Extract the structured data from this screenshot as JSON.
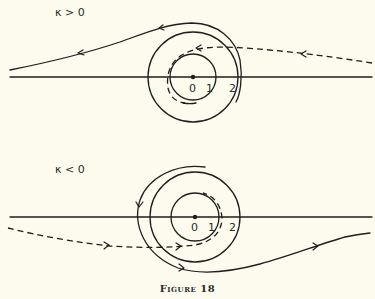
{
  "figure": {
    "caption": "Figure 18",
    "background": "#fcfbee",
    "ink": "#1e1e1e"
  },
  "panels": [
    {
      "label": "κ > 0",
      "center": [
        193,
        77
      ],
      "radii": [
        23,
        45
      ],
      "tick_labels": [
        "0",
        "1",
        "2"
      ],
      "solid_trajectory": "incoming from right, spirals around outer circle, exits to left",
      "dashed_trajectory": "incoming from right, wraps around inner circle"
    },
    {
      "label": "κ < 0",
      "center": [
        195,
        217
      ],
      "radii": [
        24,
        45
      ],
      "tick_labels": [
        "0",
        "1",
        "2"
      ],
      "solid_trajectory": "spirals around outer circle, exits to right",
      "dashed_trajectory": "incoming from left, wraps around inner circle"
    }
  ]
}
